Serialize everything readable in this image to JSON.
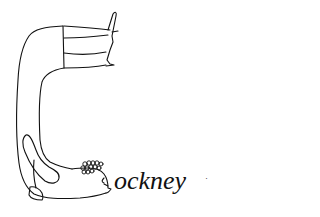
{
  "illustration": {
    "description": "Line drawing of a figure bent into the letter C",
    "word_rest": "ockney",
    "mark": "·",
    "colors": {
      "ink": "#111111",
      "background": "#ffffff"
    }
  }
}
